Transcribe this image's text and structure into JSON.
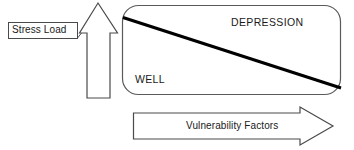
{
  "diagram": {
    "background_color": "#ffffff",
    "stroke_color": "#3a3a3a",
    "fill_color": "#ffffff",
    "divider_color": "#000000",
    "text_color": "#1a1a1a",
    "axes": {
      "vertical": {
        "name": "stress-load-axis",
        "label": "Stress Load",
        "direction": "up",
        "arrow_style": "outlined-block-arrow"
      },
      "horizontal": {
        "name": "vulnerability-factors-axis",
        "label": "Vulnerability Factors",
        "direction": "right",
        "arrow_style": "outlined-block-arrow"
      }
    },
    "plot_area": {
      "name": "outcome-region-box",
      "shape": "rounded-rectangle",
      "corner_radius": 16,
      "regions": [
        {
          "name": "depression-region",
          "label": "DEPRESSION",
          "position": "upper-right"
        },
        {
          "name": "well-region",
          "label": "WELL",
          "position": "lower-left"
        }
      ],
      "divider": {
        "name": "threshold-line",
        "type": "diagonal",
        "from": "top-left",
        "to": "bottom-right",
        "thickness": 3
      }
    }
  }
}
